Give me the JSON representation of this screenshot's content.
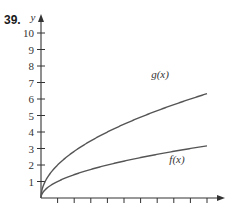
{
  "problem": {
    "number": "39."
  },
  "chart_data": {
    "type": "line",
    "title": "",
    "xlabel": "",
    "ylabel": "y",
    "xlim": [
      0,
      10.5
    ],
    "ylim": [
      0,
      10.5
    ],
    "grid": false,
    "y_tick_labels": [
      "1",
      "2",
      "3",
      "4",
      "5",
      "6",
      "7",
      "8",
      "9",
      "10"
    ],
    "x_ticks": [
      1,
      2,
      3,
      4,
      5,
      6,
      7,
      8,
      9,
      10
    ],
    "x_tick_labels_shown": false,
    "series": [
      {
        "name": "g(x)",
        "label": "g(x)",
        "formula": "2*sqrt(x)",
        "x": [
          0,
          0.25,
          0.5,
          1,
          2,
          3,
          4,
          5,
          6,
          7,
          8,
          9,
          10
        ],
        "values": [
          0,
          1.0,
          1.41,
          2.0,
          2.83,
          3.46,
          4.0,
          4.47,
          4.9,
          5.29,
          5.66,
          6.0,
          6.32
        ]
      },
      {
        "name": "f(x)",
        "label": "f(x)",
        "formula": "sqrt(x)",
        "x": [
          0,
          0.25,
          0.5,
          1,
          2,
          3,
          4,
          5,
          6,
          7,
          8,
          9,
          10
        ],
        "values": [
          0,
          0.5,
          0.71,
          1.0,
          1.41,
          1.73,
          2.0,
          2.24,
          2.45,
          2.65,
          2.83,
          3.0,
          3.16
        ]
      }
    ],
    "legend": "inline labels near curves",
    "colors": {
      "axis": "#333333",
      "curve": "#555555"
    }
  }
}
